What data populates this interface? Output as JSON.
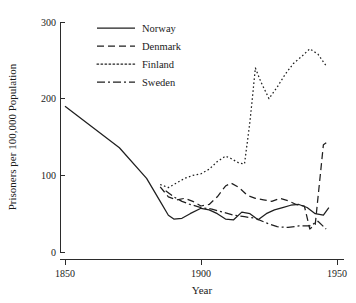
{
  "chart_data": {
    "type": "line",
    "title": "",
    "xlabel": "Year",
    "ylabel": "Prisoners per 100,000 Population",
    "xlim": [
      1845,
      1952
    ],
    "ylim": [
      0,
      310
    ],
    "xticks": [
      1850,
      1900,
      1950
    ],
    "xticklabels": [
      "1850",
      "1900",
      "1950"
    ],
    "yticks": [
      0,
      100,
      200,
      300
    ],
    "yticklabels": [
      "0",
      "100",
      "200",
      "300"
    ],
    "grid": false,
    "legend_position": "top-center",
    "line_color": "#1f1f1f",
    "background_color": "#ffffff",
    "series": [
      {
        "name": "Norway",
        "style": "solid",
        "dash": "none",
        "x": [
          1850,
          1860,
          1870,
          1880,
          1885,
          1888,
          1890,
          1893,
          1896,
          1900,
          1903,
          1906,
          1909,
          1912,
          1915,
          1918,
          1921,
          1924,
          1927,
          1930,
          1933,
          1936,
          1939,
          1942,
          1945,
          1947
        ],
        "y": [
          190,
          163,
          136,
          96,
          66,
          48,
          43,
          44,
          50,
          57,
          55,
          50,
          43,
          42,
          52,
          50,
          42,
          50,
          55,
          58,
          61,
          62,
          58,
          50,
          48,
          58
        ]
      },
      {
        "name": "Denmark",
        "style": "dashed",
        "dash": "7,4",
        "x": [
          1885,
          1888,
          1891,
          1894,
          1897,
          1900,
          1903,
          1906,
          1909,
          1911,
          1914,
          1917,
          1920,
          1923,
          1926,
          1929,
          1932,
          1935,
          1938,
          1940,
          1942,
          1945,
          1947
        ],
        "y": [
          85,
          72,
          68,
          70,
          66,
          60,
          62,
          72,
          86,
          90,
          84,
          74,
          70,
          68,
          66,
          70,
          67,
          62,
          60,
          30,
          36,
          140,
          145
        ]
      },
      {
        "name": "Finland",
        "style": "dotted",
        "dash": "1.6,2.4",
        "x": [
          1885,
          1888,
          1891,
          1894,
          1897,
          1900,
          1903,
          1906,
          1909,
          1911,
          1914,
          1916,
          1918,
          1920,
          1922,
          1925,
          1928,
          1931,
          1934,
          1937,
          1940,
          1943,
          1946
        ],
        "y": [
          88,
          84,
          90,
          96,
          100,
          102,
          108,
          118,
          125,
          122,
          116,
          115,
          170,
          240,
          222,
          200,
          215,
          232,
          246,
          255,
          265,
          258,
          243
        ]
      },
      {
        "name": "Sweden",
        "style": "dash-dot",
        "dash": "8,3,2,3",
        "x": [
          1887,
          1890,
          1893,
          1896,
          1900,
          1904,
          1908,
          1912,
          1916,
          1920,
          1924,
          1928,
          1932,
          1936,
          1940,
          1943,
          1946
        ],
        "y": [
          80,
          72,
          66,
          62,
          58,
          56,
          52,
          48,
          46,
          44,
          38,
          33,
          32,
          34,
          34,
          40,
          30
        ]
      }
    ]
  },
  "legend": {
    "items": [
      {
        "label": "Norway"
      },
      {
        "label": "Denmark"
      },
      {
        "label": "Finland"
      },
      {
        "label": "Sweden"
      }
    ]
  }
}
